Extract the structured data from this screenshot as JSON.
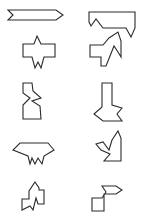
{
  "figure": {
    "stroke_color": "#2a2a2a",
    "background": "#ffffff",
    "shapes": [
      {
        "id": "shape-1",
        "row": 1,
        "col": 1,
        "name": "notched-arrow-right",
        "points": "8,10 56,10 63,15 56,20 8,20 13,15"
      },
      {
        "id": "shape-2",
        "row": 1,
        "col": 2,
        "name": "hooked-bar",
        "points": "89,12 135,12 135,28 131,37 126,28 103,28 96,19 91,26 89,22"
      },
      {
        "id": "shape-3",
        "row": 2,
        "col": 1,
        "name": "spiked-cross",
        "points": "37,36 41,44 55,44 55,57 44,57 41,68 38,62 35,68 32,57 23,57 23,44 34,44"
      },
      {
        "id": "shape-4",
        "row": 2,
        "col": 2,
        "name": "notched-t-shape",
        "points": "90,45 103,45 109,38 118,32 121,41 121,57 118,52 114,46 110,56 106,66 101,66 101,57 90,57"
      },
      {
        "id": "shape-5",
        "row": 3,
        "col": 1,
        "name": "zigzag-column",
        "points": "23,83 32,83 33,91 41,98 32,101 40,106 41,119 23,119 23,105 30,98 23,93"
      },
      {
        "id": "shape-6",
        "row": 3,
        "col": 2,
        "name": "arrow-down-notched",
        "points": "102,83 112,83 112,105 122,108 117,114 122,121 103,121 94,114 102,107"
      },
      {
        "id": "shape-7",
        "row": 4,
        "col": 1,
        "name": "crown-fringe",
        "points": "20,143 48,143 54,150 44,156 42,164 38,158 35,164 32,158 30,164 28,156 13,150"
      },
      {
        "id": "shape-8",
        "row": 4,
        "col": 2,
        "name": "zigzag-corner",
        "points": "118,131 121,138 121,161 104,161 110,154 101,150 96,144 103,142 109,150 112,140"
      },
      {
        "id": "shape-9",
        "row": 5,
        "col": 1,
        "name": "spiked-step",
        "points": "35,182 39,188 39,190 44,190 44,204 38,204 36,198 33,210 30,206 22,210 22,199 29,199 29,191"
      },
      {
        "id": "shape-10",
        "row": 5,
        "col": 2,
        "name": "zigzag-arrow-block",
        "points": "102,186 116,186 122,190 116,194 106,194 104,194 104,211 92,211 92,198 102,198 106,192"
      }
    ]
  }
}
